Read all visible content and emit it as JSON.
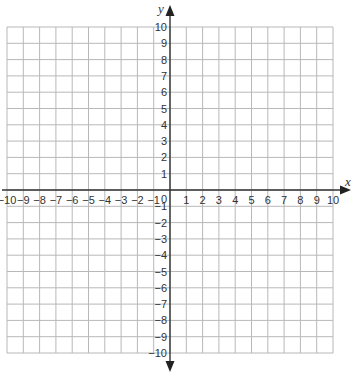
{
  "chart_data": {
    "type": "coordinate-grid",
    "title": "",
    "xlabel": "x",
    "ylabel": "y",
    "xlim": [
      -10,
      10
    ],
    "ylim": [
      -10,
      10
    ],
    "grid": true,
    "grid_step": 1,
    "origin_label": "0",
    "x_ticks": [
      -10,
      -9,
      -8,
      -7,
      -6,
      -5,
      -4,
      -3,
      -2,
      -1,
      1,
      2,
      3,
      4,
      5,
      6,
      7,
      8,
      9,
      10
    ],
    "y_ticks": [
      -10,
      -9,
      -8,
      -7,
      -6,
      -5,
      -4,
      -3,
      -2,
      -1,
      1,
      2,
      3,
      4,
      5,
      6,
      7,
      8,
      9,
      10
    ],
    "series": []
  },
  "colors": {
    "grid": "#b8b8b8",
    "axis": "#333333",
    "text": "#333333"
  }
}
